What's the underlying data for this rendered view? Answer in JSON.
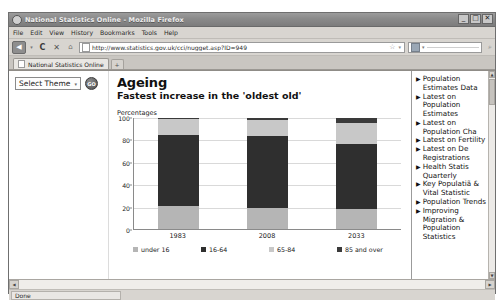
{
  "window": {
    "title": "National Statistics Online - Mozilla Firefox",
    "minimize": "_",
    "maximize": "□",
    "close": "✕"
  },
  "menubar": {
    "items": [
      "File",
      "Edit",
      "View",
      "History",
      "Bookmarks",
      "Tools",
      "Help"
    ]
  },
  "toolbar": {
    "back": "◀",
    "back_caret": "▾",
    "forward": "▶",
    "reload": "C",
    "stop": "✕",
    "home": "⌂",
    "url": "http://www.statistics.gov.uk/cci/nugget.asp?ID=949",
    "star": "☆",
    "url_caret": "▾",
    "search_caret": "▾",
    "magnifier": "⌕"
  },
  "tabs": {
    "items": [
      {
        "label": "National Statistics Online"
      }
    ],
    "new_tab": "+"
  },
  "left_panel": {
    "theme_select_value": "Select Theme",
    "theme_select_caret": "▾",
    "go_label": "GO"
  },
  "main": {
    "title": "Ageing",
    "subtitle": "Fastest increase in the 'oldest old'"
  },
  "sidebar": {
    "bullet": "▶",
    "links": [
      "Population Estimates Data",
      "Latest on Population Estimates",
      "Latest on Population Cha",
      "Latest on Fertility",
      "Latest on De Registrations",
      "Health Statis Quarterly",
      "Key Populatiã & Vital Statistic",
      "Population Trends",
      "Improving Migration & Population Statistics"
    ],
    "scroll_up": "▲",
    "scroll_down": "▼"
  },
  "scrollbars": {
    "left_arrow": "◀",
    "right_arrow": "▶"
  },
  "statusbar": {
    "text": "Done"
  },
  "chart_data": {
    "type": "bar",
    "subtype": "stacked-bar",
    "title": "Ageing",
    "subtitle": "Fastest increase in the 'oldest old'",
    "ylabel": "Percentages",
    "xlabel": "",
    "categories": [
      "1983",
      "2008",
      "2033"
    ],
    "ylim": [
      0,
      100
    ],
    "yticks": [
      0,
      20,
      40,
      60,
      80,
      100
    ],
    "grid": true,
    "legend_position": "bottom",
    "series": [
      {
        "name": "under 16",
        "values": [
          21,
          19,
          18
        ],
        "color": "#b5b5b5"
      },
      {
        "name": "16-64",
        "values": [
          64,
          65,
          59
        ],
        "color": "#2f2f2f"
      },
      {
        "name": "65-84",
        "values": [
          14,
          14,
          19
        ],
        "color": "#c8c8c8"
      },
      {
        "name": "85 and over",
        "values": [
          1,
          2,
          4
        ],
        "color": "#3a3a3a"
      }
    ]
  }
}
